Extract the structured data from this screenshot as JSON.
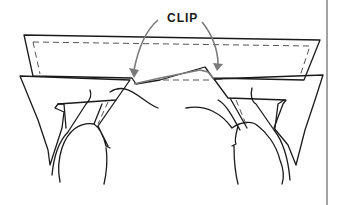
{
  "diagram": {
    "label": "CLIP",
    "colors": {
      "line": "#1a1a1a",
      "fabric_fill": "#e8e8e8",
      "arrow": "#7a7a7a",
      "background": "#ffffff"
    }
  }
}
